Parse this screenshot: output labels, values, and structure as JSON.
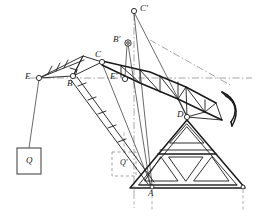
{
  "figure": {
    "type": "mechanism-kinematic-diagram",
    "background_color": "#ffffff",
    "line_color": "#1a1a1a",
    "centerline_color": "#8a8a8a",
    "dashed_color": "#9a9a9a"
  },
  "labels": {
    "E": "E",
    "E_prime": "E′",
    "B": "B",
    "B_prime": "B′",
    "C": "C",
    "C_prime": "C′",
    "D": "D",
    "A": "A",
    "Q": "Q",
    "Q_prime": "Q′"
  },
  "points": {
    "E": {
      "x": 39,
      "y": 78,
      "label": "E",
      "joint": true
    },
    "E_prime": {
      "x": 125,
      "y": 79,
      "label": "E′",
      "joint": true
    },
    "B": {
      "x": 73,
      "y": 76,
      "label": "B",
      "joint": true
    },
    "B_prime": {
      "x": 127,
      "y": 41,
      "label": "B′",
      "joint": true
    },
    "C": {
      "x": 102,
      "y": 62,
      "label": "C",
      "joint": true
    },
    "C_prime": {
      "x": 134,
      "y": 11,
      "label": "C′",
      "joint": true
    },
    "D": {
      "x": 186,
      "y": 116,
      "label": "D",
      "joint": true
    },
    "A": {
      "x": 152,
      "y": 186,
      "label": "A",
      "joint": false
    },
    "Q_box": {
      "x": 17,
      "y": 148,
      "w": 24,
      "h": 26,
      "label": "Q"
    },
    "Q_prime_box": {
      "x": 112,
      "y": 152,
      "w": 24,
      "h": 24,
      "label": "Q′"
    }
  },
  "elements": [
    {
      "name": "centerline-E-to-Eprime",
      "kind": "dash-dot horizontal axis"
    },
    {
      "name": "centerline-Cprime-Bprime",
      "kind": "dash-dot vertical axis"
    },
    {
      "name": "boom-lattice",
      "kind": "triangulated boom truss from E toward D and bucket"
    },
    {
      "name": "bucket-arc",
      "kind": "curved scoop at far right"
    },
    {
      "name": "support-truss",
      "kind": "sierpinski triangular lattice frame"
    },
    {
      "name": "hoist-rope-Q",
      "kind": "vertical rope from E to weight Q"
    },
    {
      "name": "dimension-lines",
      "kind": "dashed vertical extension lines below base"
    }
  ]
}
